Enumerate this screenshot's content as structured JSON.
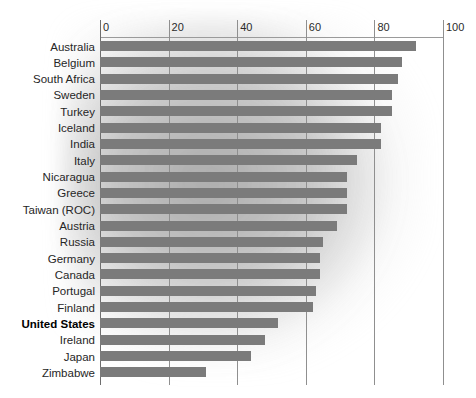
{
  "chart_data": {
    "type": "bar",
    "orientation": "horizontal",
    "title": "",
    "subtitle": "",
    "xlabel": "",
    "ylabel": "",
    "xlim": [
      0,
      100
    ],
    "ylim": null,
    "grid": true,
    "legend": null,
    "legend_position": "none",
    "xticks": [
      0,
      20,
      40,
      60,
      80,
      100
    ],
    "xtick_labels": [
      "0",
      "20",
      "40",
      "60",
      "80",
      "100"
    ],
    "axis_position": "top",
    "bar_color": "#7b7b7b",
    "highlight_category": "United States",
    "categories": [
      "Australia",
      "Belgium",
      "South Africa",
      "Sweden",
      "Turkey",
      "Iceland",
      "India",
      "Italy",
      "Nicaragua",
      "Greece",
      "Taiwan (ROC)",
      "Austria",
      "Russia",
      "Germany",
      "Canada",
      "Portugal",
      "Finland",
      "United States",
      "Ireland",
      "Japan",
      "Zimbabwe"
    ],
    "values": [
      92,
      88,
      87,
      85,
      85,
      82,
      82,
      75,
      72,
      72,
      72,
      69,
      65,
      64,
      64,
      63,
      62,
      52,
      48,
      44,
      31
    ]
  }
}
